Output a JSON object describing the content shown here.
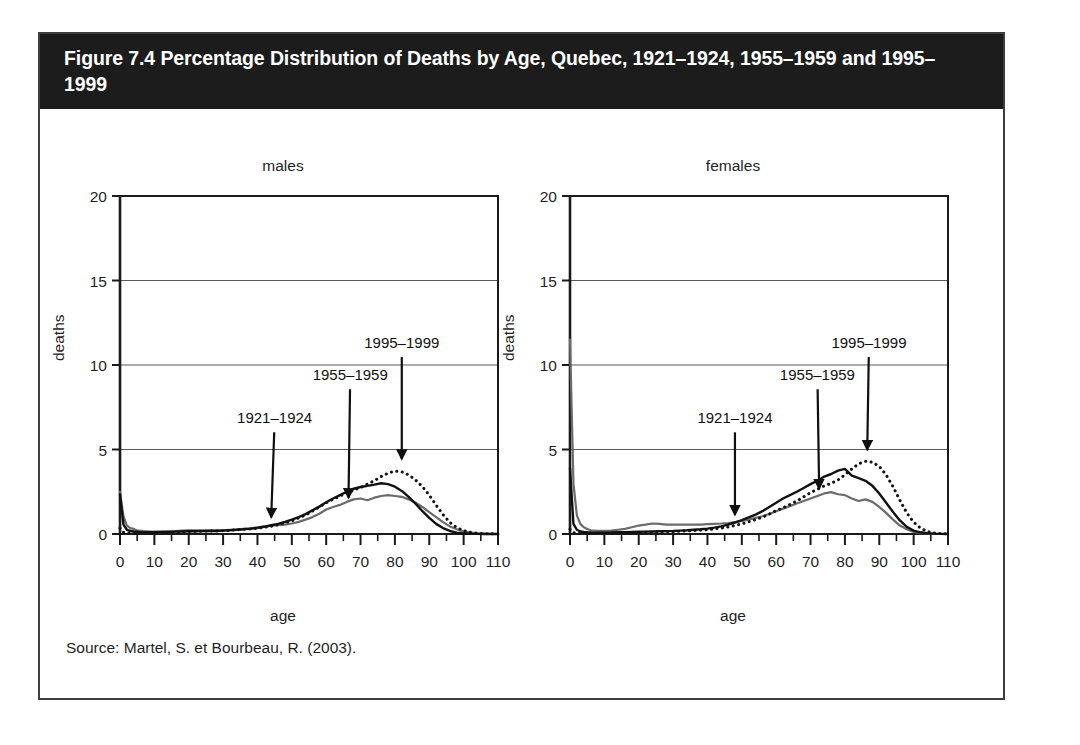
{
  "figure": {
    "title": "Figure 7.4 Percentage Distribution of Deaths by Age, Quebec, 1921–1924, 1955–1959 and 1995–1999",
    "source": "Source: Martel, S. et Bourbeau, R. (2003).",
    "banner_color": "#1c1c1c",
    "frame_color": "#3d3d3d"
  },
  "chart_data": [
    {
      "type": "line",
      "title": "males",
      "xlabel": "age",
      "ylabel": "deaths",
      "xlim": [
        0,
        110
      ],
      "ylim": [
        0,
        20
      ],
      "xticks": [
        0,
        10,
        20,
        30,
        40,
        50,
        60,
        70,
        80,
        90,
        100,
        110
      ],
      "yticks": [
        0,
        5,
        10,
        15,
        20
      ],
      "xtick_labels": [
        "0",
        "10",
        "20",
        "30",
        "40",
        "50",
        "60",
        "70",
        "80",
        "90",
        "100",
        "110"
      ],
      "ytick_labels": [
        "0",
        "5",
        "10",
        "15",
        "20"
      ],
      "minor_xtick_step": 5,
      "grid": "horizontal",
      "legend": "annotations",
      "annotations": [
        {
          "label": "1921–1924",
          "text_x": 45,
          "text_y": 6.55,
          "point_x": 44,
          "point_y": 0.75
        },
        {
          "label": "1955–1959",
          "text_x": 67,
          "text_y": 9.1,
          "point_x": 66.5,
          "point_y": 1.9
        },
        {
          "label": "1995–1999",
          "text_x": 82,
          "text_y": 11.0,
          "point_x": 82,
          "point_y": 4.2
        }
      ],
      "series": [
        {
          "name": "1921–1924",
          "color": "#6b6b6b",
          "style": "solid",
          "width": 2.2,
          "x": [
            0,
            1,
            2,
            3,
            4,
            5,
            6,
            7,
            8,
            9,
            10,
            12,
            14,
            16,
            18,
            20,
            22,
            24,
            26,
            28,
            30,
            32,
            34,
            36,
            38,
            40,
            42,
            44,
            46,
            48,
            50,
            52,
            54,
            56,
            58,
            60,
            62,
            64,
            66,
            68,
            70,
            72,
            74,
            76,
            78,
            80,
            82,
            84,
            86,
            88,
            90,
            92,
            94,
            96,
            98,
            100,
            102,
            104,
            106,
            108,
            110
          ],
          "values": [
            2.5,
            1.05,
            0.5,
            0.35,
            0.3,
            0.2,
            0.18,
            0.16,
            0.15,
            0.14,
            0.14,
            0.15,
            0.16,
            0.17,
            0.2,
            0.22,
            0.22,
            0.22,
            0.22,
            0.22,
            0.22,
            0.24,
            0.26,
            0.3,
            0.32,
            0.34,
            0.42,
            0.5,
            0.52,
            0.55,
            0.62,
            0.72,
            0.85,
            1.0,
            1.2,
            1.45,
            1.6,
            1.72,
            1.9,
            2.05,
            2.1,
            2.0,
            2.15,
            2.25,
            2.3,
            2.25,
            2.2,
            2.05,
            1.85,
            1.6,
            1.3,
            1.0,
            0.7,
            0.45,
            0.28,
            0.15,
            0.08,
            0.04,
            0.02,
            0.01,
            0.0
          ]
        },
        {
          "name": "1955–1959",
          "color": "#111111",
          "style": "solid",
          "width": 2.4,
          "x": [
            0,
            1,
            2,
            3,
            4,
            5,
            6,
            7,
            8,
            9,
            10,
            12,
            14,
            16,
            18,
            20,
            22,
            24,
            26,
            28,
            30,
            32,
            34,
            36,
            38,
            40,
            42,
            44,
            46,
            48,
            50,
            52,
            54,
            56,
            58,
            60,
            62,
            64,
            66,
            68,
            70,
            72,
            74,
            76,
            78,
            80,
            82,
            84,
            86,
            88,
            90,
            92,
            94,
            96,
            98,
            100,
            102,
            104,
            106,
            108,
            110
          ],
          "values": [
            2.35,
            0.55,
            0.25,
            0.18,
            0.15,
            0.13,
            0.11,
            0.1,
            0.1,
            0.1,
            0.1,
            0.1,
            0.12,
            0.14,
            0.15,
            0.16,
            0.16,
            0.17,
            0.18,
            0.18,
            0.2,
            0.22,
            0.25,
            0.28,
            0.32,
            0.38,
            0.44,
            0.52,
            0.6,
            0.72,
            0.85,
            1.0,
            1.18,
            1.4,
            1.62,
            1.88,
            2.1,
            2.3,
            2.5,
            2.68,
            2.78,
            2.85,
            2.92,
            3.0,
            2.95,
            2.8,
            2.55,
            2.2,
            1.8,
            1.35,
            0.95,
            0.6,
            0.35,
            0.18,
            0.08,
            0.04,
            0.02,
            0.01,
            0.0,
            0.0,
            0.0
          ]
        },
        {
          "name": "1995–1999",
          "color": "#111111",
          "style": "dotted",
          "width": 3.0,
          "x": [
            0,
            1,
            2,
            3,
            4,
            5,
            6,
            7,
            8,
            9,
            10,
            12,
            14,
            16,
            18,
            20,
            22,
            24,
            26,
            28,
            30,
            32,
            34,
            36,
            38,
            40,
            42,
            44,
            46,
            48,
            50,
            52,
            54,
            56,
            58,
            60,
            62,
            64,
            66,
            68,
            70,
            72,
            74,
            76,
            78,
            80,
            82,
            84,
            86,
            88,
            90,
            92,
            94,
            96,
            98,
            100,
            102,
            104,
            106,
            108,
            110
          ],
          "values": [
            0.35,
            0.1,
            0.06,
            0.05,
            0.05,
            0.05,
            0.05,
            0.05,
            0.05,
            0.05,
            0.06,
            0.07,
            0.08,
            0.1,
            0.12,
            0.14,
            0.15,
            0.16,
            0.17,
            0.18,
            0.2,
            0.22,
            0.25,
            0.28,
            0.3,
            0.34,
            0.4,
            0.46,
            0.55,
            0.65,
            0.78,
            0.95,
            1.12,
            1.35,
            1.6,
            1.85,
            2.05,
            2.25,
            2.42,
            2.6,
            2.75,
            2.95,
            3.15,
            3.4,
            3.6,
            3.72,
            3.68,
            3.5,
            3.2,
            2.8,
            2.3,
            1.7,
            1.15,
            0.68,
            0.38,
            0.2,
            0.1,
            0.05,
            0.02,
            0.01,
            0.0
          ]
        }
      ]
    },
    {
      "type": "line",
      "title": "females",
      "xlabel": "age",
      "ylabel": "deaths",
      "xlim": [
        0,
        110
      ],
      "ylim": [
        0,
        20
      ],
      "xticks": [
        0,
        10,
        20,
        30,
        40,
        50,
        60,
        70,
        80,
        90,
        100,
        110
      ],
      "yticks": [
        0,
        5,
        10,
        15,
        20
      ],
      "xtick_labels": [
        "0",
        "10",
        "20",
        "30",
        "40",
        "50",
        "60",
        "70",
        "80",
        "90",
        "100",
        "110"
      ],
      "ytick_labels": [
        "0",
        "5",
        "10",
        "15",
        "20"
      ],
      "minor_xtick_step": 5,
      "grid": "horizontal",
      "legend": "annotations",
      "annotations": [
        {
          "label": "1921–1924",
          "text_x": 48,
          "text_y": 6.55,
          "point_x": 48,
          "point_y": 0.9
        },
        {
          "label": "1955–1959",
          "text_x": 72,
          "text_y": 9.1,
          "point_x": 72.5,
          "point_y": 2.45
        },
        {
          "label": "1995–1999",
          "text_x": 87,
          "text_y": 11.0,
          "point_x": 86.5,
          "point_y": 4.75
        }
      ],
      "series": [
        {
          "name": "1921–1924",
          "color": "#6b6b6b",
          "style": "solid",
          "width": 2.2,
          "x": [
            0,
            1,
            2,
            3,
            4,
            5,
            6,
            7,
            8,
            9,
            10,
            12,
            14,
            16,
            18,
            20,
            22,
            24,
            26,
            28,
            30,
            32,
            34,
            36,
            38,
            40,
            42,
            44,
            46,
            48,
            50,
            52,
            54,
            56,
            58,
            60,
            62,
            64,
            66,
            68,
            70,
            72,
            74,
            76,
            78,
            80,
            82,
            84,
            86,
            88,
            90,
            92,
            94,
            96,
            98,
            100,
            102,
            104,
            106,
            108,
            110
          ],
          "values": [
            11.5,
            3.0,
            1.1,
            0.6,
            0.4,
            0.3,
            0.22,
            0.2,
            0.18,
            0.18,
            0.18,
            0.2,
            0.25,
            0.3,
            0.4,
            0.5,
            0.55,
            0.62,
            0.6,
            0.55,
            0.55,
            0.55,
            0.55,
            0.55,
            0.56,
            0.58,
            0.6,
            0.62,
            0.65,
            0.7,
            0.78,
            0.85,
            0.95,
            1.05,
            1.18,
            1.35,
            1.5,
            1.65,
            1.8,
            1.95,
            2.1,
            2.25,
            2.4,
            2.48,
            2.35,
            2.3,
            2.1,
            1.95,
            2.05,
            1.9,
            1.6,
            1.25,
            0.85,
            0.5,
            0.28,
            0.12,
            0.06,
            0.03,
            0.01,
            0.0,
            0.0
          ]
        },
        {
          "name": "1955–1959",
          "color": "#111111",
          "style": "solid",
          "width": 2.4,
          "x": [
            0,
            1,
            2,
            3,
            4,
            5,
            6,
            7,
            8,
            9,
            10,
            12,
            14,
            16,
            18,
            20,
            22,
            24,
            26,
            28,
            30,
            32,
            34,
            36,
            38,
            40,
            42,
            44,
            46,
            48,
            50,
            52,
            54,
            56,
            58,
            60,
            62,
            64,
            66,
            68,
            70,
            72,
            74,
            76,
            78,
            80,
            82,
            84,
            86,
            88,
            90,
            92,
            94,
            96,
            98,
            100,
            102,
            104,
            106,
            108,
            110
          ],
          "values": [
            3.9,
            0.6,
            0.25,
            0.15,
            0.12,
            0.1,
            0.09,
            0.08,
            0.08,
            0.08,
            0.08,
            0.09,
            0.1,
            0.11,
            0.12,
            0.13,
            0.14,
            0.15,
            0.16,
            0.17,
            0.18,
            0.2,
            0.22,
            0.25,
            0.28,
            0.32,
            0.38,
            0.45,
            0.55,
            0.68,
            0.82,
            0.98,
            1.15,
            1.35,
            1.6,
            1.85,
            2.1,
            2.3,
            2.5,
            2.72,
            2.95,
            3.15,
            3.4,
            3.55,
            3.75,
            3.85,
            3.45,
            3.3,
            3.15,
            2.85,
            2.4,
            1.85,
            1.3,
            0.8,
            0.42,
            0.2,
            0.1,
            0.05,
            0.02,
            0.01,
            0.0
          ]
        },
        {
          "name": "1995–1999",
          "color": "#111111",
          "style": "dotted",
          "width": 3.0,
          "x": [
            0,
            1,
            2,
            3,
            4,
            5,
            6,
            7,
            8,
            9,
            10,
            12,
            14,
            16,
            18,
            20,
            22,
            24,
            26,
            28,
            30,
            32,
            34,
            36,
            38,
            40,
            42,
            44,
            46,
            48,
            50,
            52,
            54,
            56,
            58,
            60,
            62,
            64,
            66,
            68,
            70,
            72,
            74,
            76,
            78,
            80,
            82,
            84,
            86,
            88,
            90,
            92,
            94,
            96,
            98,
            100,
            102,
            104,
            106,
            108,
            110
          ],
          "values": [
            0.28,
            0.08,
            0.05,
            0.04,
            0.04,
            0.04,
            0.04,
            0.04,
            0.04,
            0.04,
            0.05,
            0.05,
            0.06,
            0.07,
            0.08,
            0.09,
            0.1,
            0.11,
            0.12,
            0.13,
            0.14,
            0.16,
            0.18,
            0.2,
            0.22,
            0.25,
            0.3,
            0.35,
            0.42,
            0.5,
            0.6,
            0.72,
            0.85,
            1.0,
            1.18,
            1.38,
            1.55,
            1.75,
            1.95,
            2.2,
            2.45,
            2.65,
            2.85,
            3.0,
            3.2,
            3.5,
            3.85,
            4.15,
            4.3,
            4.25,
            4.0,
            3.5,
            2.8,
            2.0,
            1.25,
            0.7,
            0.35,
            0.15,
            0.06,
            0.02,
            0.0
          ]
        }
      ]
    }
  ]
}
